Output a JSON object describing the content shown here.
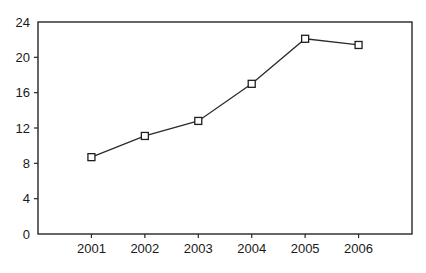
{
  "chart_data": {
    "type": "line",
    "title": "",
    "subtitle": "",
    "xlabel": "",
    "ylabel": "",
    "categories": [
      "2001",
      "2002",
      "2003",
      "2004",
      "2005",
      "2006"
    ],
    "values": [
      8.7,
      11.1,
      12.8,
      17.0,
      22.1,
      21.4
    ],
    "series": [
      {
        "name": "",
        "values": [
          8.7,
          11.1,
          12.8,
          17.0,
          22.1,
          21.4
        ]
      }
    ],
    "ylim": [
      0,
      24
    ],
    "yticks": [
      0,
      4,
      8,
      12,
      16,
      20,
      24
    ],
    "ytick_labels": [
      "0",
      "4",
      "8",
      "12",
      "16",
      "20",
      "24"
    ],
    "xtick_labels": [
      "2001",
      "2002",
      "2003",
      "2004",
      "2005",
      "2006"
    ],
    "grid": false,
    "legend": false,
    "legend_position": "none",
    "marker": "open-square",
    "line_color": "#2b2b2b",
    "marker_fill": "#ffffff",
    "marker_stroke": "#1f1f1f",
    "axis_color": "#262626",
    "background_color": "#ffffff",
    "annotations": []
  }
}
